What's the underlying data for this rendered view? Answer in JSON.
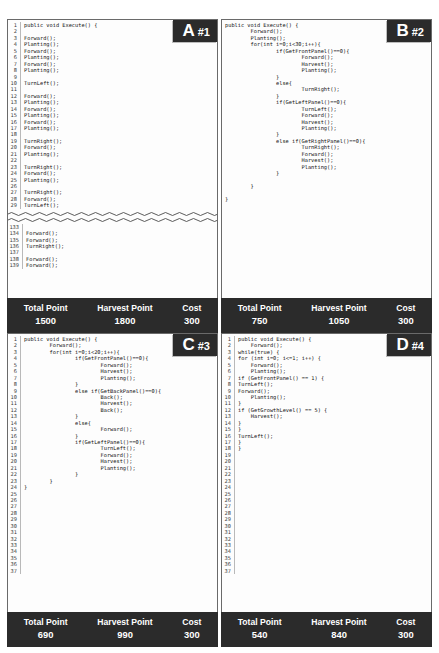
{
  "panels": [
    {
      "id": "panel-a",
      "badge_letter": "A",
      "badge_number": "#1",
      "numbered": true,
      "start_line": 1,
      "lines": [
        "public void Execute() {",
        "",
        "Forward();",
        "Planting();",
        "Forward();",
        "Planting();",
        "Forward();",
        "Planting();",
        "",
        "TurnLeft();",
        "",
        "Forward();",
        "Planting();",
        "Forward();",
        "Planting();",
        "Forward();",
        "Planting();",
        "",
        "TurnRight();",
        "Forward();",
        "Planting();",
        "",
        "TurnRight();",
        "Forward();",
        "Planting();",
        "",
        "TurnRight();",
        "Forward();",
        "TurnLeft();"
      ],
      "truncated": true,
      "tail_start_line": 133,
      "tail_lines": [
        "",
        "Forward();",
        "Forward();",
        "TurnRight();",
        "",
        "Forward();",
        "Forward();"
      ],
      "footer": {
        "total_label": "Total Point",
        "harvest_label": "Harvest Point",
        "cost_label": "Cost",
        "total_value": "1500",
        "harvest_value": "1800",
        "cost_value": "300"
      }
    },
    {
      "id": "panel-b",
      "badge_letter": "B",
      "badge_number": "#2",
      "numbered": false,
      "lines": [
        "public void Execute() {",
        "        Forward();",
        "        Planting();",
        "        for(int i=0;i<30;i++){",
        "                if(GetFrontPanel()==0){",
        "                        Forward();",
        "                        Harvest();",
        "                        Planting();",
        "                }",
        "                else{",
        "                        TurnRight();",
        "                }",
        "                if(GetLeftPanel()==0){",
        "                        TurnLeft();",
        "                        Forward();",
        "                        Harvest();",
        "                        Planting();",
        "                }",
        "                else if(GetRightPanel()==0){",
        "                        TurnRight();",
        "                        Forward();",
        "                        Harvest();",
        "                        Planting();",
        "                }",
        "",
        "        }",
        "",
        "}"
      ],
      "truncated": false,
      "footer": {
        "total_label": "Total Point",
        "harvest_label": "Harvest Point",
        "cost_label": "Cost",
        "total_value": "750",
        "harvest_value": "1050",
        "cost_value": "300"
      }
    },
    {
      "id": "panel-c",
      "badge_letter": "C",
      "badge_number": "#3",
      "numbered": true,
      "start_line": 1,
      "lines": [
        "public void Execute() {",
        "        Forward();",
        "        for(int i=0;i<20;i++){",
        "                if(GetFrontPanel()==0){",
        "                        Forward();",
        "                        Harvest();",
        "                        Planting();",
        "                }",
        "                else if(GetBackPanel()==0){",
        "                        Back();",
        "                        Harvest();",
        "                        Back();",
        "                }",
        "                else{",
        "                        Forward();",
        "                }",
        "                if(GetLeftPanel()==0){",
        "                        TurnLeft();",
        "                        Forward();",
        "                        Harvest();",
        "                        Planting();",
        "                }",
        "        }",
        "}",
        "",
        "",
        "",
        "",
        "",
        "",
        "",
        "",
        "",
        "",
        "",
        "",
        ""
      ],
      "truncated": false,
      "footer": {
        "total_label": "Total Point",
        "harvest_label": "Harvest Point",
        "cost_label": "Cost",
        "total_value": "690",
        "harvest_value": "990",
        "cost_value": "300"
      }
    },
    {
      "id": "panel-d",
      "badge_letter": "D",
      "badge_number": "#4",
      "numbered": true,
      "start_line": 1,
      "lines": [
        "public void Execute() {",
        "    Forward();",
        "while(true) {",
        "for (int i=0; i<=1; i++) {",
        "    Forward();",
        "    Planting();",
        "if (GetFrontPanel() == 1) {",
        "TurnLeft();",
        "Forward();",
        "    Planting();",
        "}",
        "if (GetGrowthLevel() == 5) {",
        "    Harvest();",
        "}",
        "}",
        "TurnLeft();",
        "}",
        "}",
        "",
        "",
        "",
        "",
        "",
        "",
        "",
        "",
        "",
        "",
        "",
        "",
        "",
        "",
        "",
        "",
        "",
        "",
        ""
      ],
      "truncated": false,
      "footer": {
        "total_label": "Total Point",
        "harvest_label": "Harvest Point",
        "cost_label": "Cost",
        "total_value": "540",
        "harvest_value": "840",
        "cost_value": "300"
      }
    }
  ]
}
